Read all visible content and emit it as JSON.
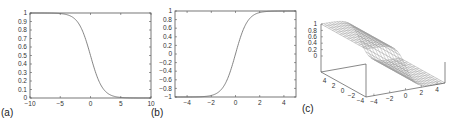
{
  "chart_data": [
    {
      "id": "a",
      "type": "line",
      "panel_label": "(a)",
      "title": "",
      "xlabel": "",
      "ylabel": "",
      "xlim": [
        -10,
        10
      ],
      "ylim": [
        0,
        1
      ],
      "x_ticks": [
        "-10",
        "-5",
        "0",
        "5",
        "10"
      ],
      "y_ticks": [
        "0",
        "0.1",
        "0.2",
        "0.3",
        "0.4",
        "0.5",
        "0.6",
        "0.7",
        "0.8",
        "0.9",
        "1"
      ],
      "grid": false,
      "series": [
        {
          "name": "decreasing sigmoid",
          "x": [
            -10,
            -5,
            -4,
            -3,
            -2,
            -1,
            0,
            1,
            2,
            3,
            4,
            5,
            10
          ],
          "y": [
            1.0,
            0.99,
            0.98,
            0.95,
            0.88,
            0.73,
            0.5,
            0.27,
            0.12,
            0.05,
            0.02,
            0.007,
            0.0
          ]
        }
      ]
    },
    {
      "id": "b",
      "type": "line",
      "panel_label": "(b)",
      "title": "",
      "xlabel": "",
      "ylabel": "",
      "xlim": [
        -5,
        5
      ],
      "ylim": [
        -1,
        1
      ],
      "x_ticks": [
        "-4",
        "-2",
        "0",
        "2",
        "4"
      ],
      "y_ticks": [
        "-1",
        "-0.8",
        "-0.6",
        "-0.4",
        "-0.2",
        "0",
        "0.2",
        "0.4",
        "0.6",
        "0.8",
        "1"
      ],
      "grid": false,
      "series": [
        {
          "name": "tanh",
          "x": [
            -5,
            -3,
            -2,
            -1.5,
            -1,
            -0.5,
            0,
            0.5,
            1,
            1.5,
            2,
            3,
            5
          ],
          "y": [
            -1.0,
            -0.995,
            -0.96,
            -0.9,
            -0.76,
            -0.46,
            0.0,
            0.46,
            0.76,
            0.9,
            0.96,
            0.995,
            1.0
          ]
        }
      ]
    },
    {
      "id": "c",
      "type": "surface",
      "panel_label": "(c)",
      "title": "",
      "xlim": [
        -5,
        5
      ],
      "ylim": [
        -5,
        5
      ],
      "zlim": [
        0,
        1
      ],
      "x_ticks": [
        "-4",
        "-2",
        "0",
        "2",
        "4"
      ],
      "y_ticks": [
        "4",
        "2",
        "0",
        "-2",
        "-4"
      ],
      "z_ticks": [
        "0",
        "0.2",
        "0.4",
        "0.6",
        "0.8",
        "1"
      ],
      "description": "Wireframe surface: sigmoid step along x from 1 to 0, constant along y"
    }
  ]
}
